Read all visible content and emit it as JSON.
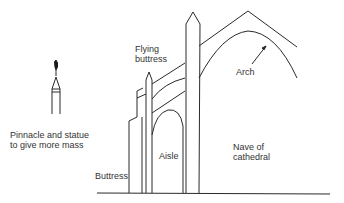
{
  "diagram": {
    "labels": {
      "flying_buttress_line1": "Flying",
      "flying_buttress_line2": "buttress",
      "arch": "Arch",
      "pinnacle_line1": "Pinnacle and statue",
      "pinnacle_line2": "to give more mass",
      "aisle": "Aisle",
      "nave_line1": "Nave of",
      "nave_line2": "cathedral",
      "buttress": "Buttress"
    },
    "colors": {
      "line": "#2a2a2a",
      "text": "#333333",
      "background": "#ffffff"
    }
  }
}
